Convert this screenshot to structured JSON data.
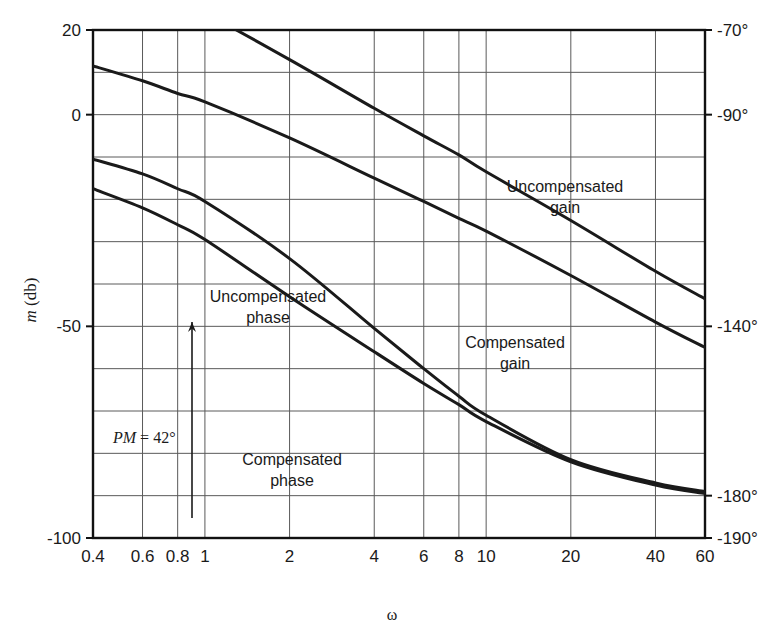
{
  "figure": {
    "kind": "bode-plot",
    "background": "#ffffff",
    "ink": "#1a1a1a",
    "grid_color": "#5a5a5a",
    "frame_color": "#111111"
  },
  "chart_data": {
    "type": "line",
    "title": "",
    "xlabel": "ω",
    "ylabel": "m (db)",
    "ylabel_parts": {
      "italic": "m",
      "rest": "(db)"
    },
    "y2label": "",
    "xscale": "log",
    "xlim": [
      0.4,
      60
    ],
    "ylim": [
      -100,
      20
    ],
    "y2lim": [
      -190,
      -70
    ],
    "grid": true,
    "legend": "inline-annotations",
    "xticks": [
      0.4,
      0.6,
      0.8,
      1,
      2,
      4,
      6,
      8,
      10,
      20,
      40,
      60
    ],
    "xticklabels": [
      "0.4",
      "0.6",
      "0.8",
      "1",
      "2",
      "4",
      "6",
      "8",
      "10",
      "20",
      "40",
      "60"
    ],
    "yticks": [
      20,
      0,
      -50,
      -100
    ],
    "yticklabels": [
      "20",
      "0",
      "-50",
      "-100"
    ],
    "y_gridline_step_db": 10,
    "y2ticks": [
      -70,
      -90,
      -140,
      -180,
      -190
    ],
    "y2ticklabels": [
      "-70°",
      "-90°",
      "-140°",
      "-180°",
      "-190°"
    ],
    "series": [
      {
        "name": "Uncompensated gain",
        "axis": "left",
        "unit": "db",
        "x": [
          0.4,
          0.6,
          0.8,
          1,
          2,
          4,
          6,
          8,
          10,
          20,
          40,
          60
        ],
        "values": [
          36.0,
          30.5,
          26.5,
          24.0,
          13.0,
          1.5,
          -5.0,
          -9.5,
          -13.5,
          -25.0,
          -37.0,
          -43.5
        ]
      },
      {
        "name": "Compensated gain",
        "axis": "left",
        "unit": "db",
        "x": [
          0.4,
          0.6,
          0.8,
          1,
          2,
          4,
          6,
          8,
          10,
          20,
          40,
          60
        ],
        "values": [
          11.5,
          8.0,
          5.0,
          3.0,
          -5.5,
          -15.0,
          -20.5,
          -24.5,
          -27.5,
          -38.0,
          -49.0,
          -55.0
        ]
      },
      {
        "name": "Uncompensated phase",
        "axis": "right",
        "unit": "deg",
        "x": [
          0.4,
          0.6,
          0.8,
          1,
          2,
          4,
          6,
          8,
          10,
          20,
          40,
          60
        ],
        "values": [
          -100.5,
          -104.0,
          -107.5,
          -110.5,
          -124.0,
          -140.5,
          -150.0,
          -156.5,
          -161.0,
          -171.5,
          -177.0,
          -179.0
        ]
      },
      {
        "name": "Compensated phase",
        "axis": "right",
        "unit": "deg",
        "x": [
          0.4,
          0.6,
          0.8,
          1,
          2,
          4,
          6,
          8,
          10,
          20,
          40,
          60
        ],
        "values": [
          -107.5,
          -112.0,
          -116.0,
          -119.5,
          -133.0,
          -146.0,
          -153.5,
          -158.5,
          -162.5,
          -172.0,
          -177.5,
          -179.5
        ]
      }
    ],
    "annotations": [
      {
        "id": "uncompensated-gain",
        "text_line1": "Uncompensated",
        "text_line2": "gain",
        "x": 565,
        "y": 192
      },
      {
        "id": "compensated-gain",
        "text_line1": "Compensated",
        "text_line2": "gain",
        "x": 515,
        "y": 348
      },
      {
        "id": "uncompensated-phase",
        "text_line1": "Uncompensated",
        "text_line2": "phase",
        "x": 268,
        "y": 302
      },
      {
        "id": "compensated-phase",
        "text_line1": "Compensated",
        "text_line2": "phase",
        "x": 292,
        "y": 465
      },
      {
        "id": "phase-margin",
        "text": "PM = 42°",
        "italic_part": "PM",
        "rest_part": " = 42°",
        "x": 113,
        "y": 443,
        "arrow_x": 192,
        "arrow_y_top": 322,
        "arrow_y_bottom": 518
      }
    ]
  }
}
